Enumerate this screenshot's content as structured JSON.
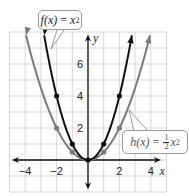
{
  "chart_data": {
    "type": "line",
    "title": "",
    "xlabel": "x",
    "ylabel": "y",
    "xlim": [
      -5,
      5
    ],
    "ylim": [
      -2,
      8
    ],
    "grid": true,
    "x_ticks": [
      -4,
      -2,
      2,
      4
    ],
    "y_ticks": [
      2,
      4,
      6
    ],
    "x_tick_labels": [
      "−4",
      "−2",
      "2",
      "4"
    ],
    "y_tick_labels": [
      "2",
      "4",
      "6"
    ],
    "series": [
      {
        "name": "f(x) = x^2",
        "label_func": "f(x)",
        "label_expr": "x",
        "label_exp": "2",
        "color": "#111111",
        "points": [
          [
            -2,
            4
          ],
          [
            -1,
            1
          ],
          [
            0,
            0
          ],
          [
            1,
            1
          ],
          [
            2,
            4
          ]
        ],
        "coef": 1
      },
      {
        "name": "h(x) = 1/2 x^2",
        "label_func": "h(x)",
        "label_frac_num": "1",
        "label_frac_den": "2",
        "label_expr": "x",
        "label_exp": "2",
        "color": "#7a7a7a",
        "points": [
          [
            -2,
            2
          ],
          [
            -1,
            0.5
          ],
          [
            0,
            0
          ],
          [
            1,
            0.5
          ],
          [
            2,
            2
          ]
        ],
        "coef": 0.5
      }
    ],
    "legend_position": "callouts"
  },
  "labels": {
    "f_func": "f(x)",
    "f_eq": "=",
    "f_var": "x",
    "f_exp": "2",
    "h_func": "h(x)",
    "h_eq": "=",
    "h_num": "1",
    "h_den": "2",
    "h_var": "x",
    "h_exp": "2",
    "x_axis": "x",
    "y_axis": "y"
  }
}
